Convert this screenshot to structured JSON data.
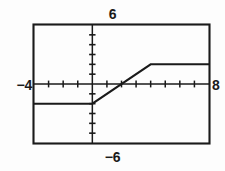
{
  "graph": {
    "title": "",
    "labels": {
      "xmin": "−4",
      "xmax": "8",
      "ymax": "6",
      "ymin": "−6"
    },
    "window": {
      "xmin_value": -4,
      "xmax_value": 8,
      "ymin_value": -6,
      "ymax_value": 6,
      "xscl": 1,
      "yscl": 1
    },
    "colors": {
      "frame": "#1a1a1a",
      "axis": "#1a1a1a",
      "curve": "#1a1a1a",
      "background": "#fdfdfd",
      "text": "#1a1a1a"
    }
  },
  "chart_data": {
    "type": "line",
    "title": "",
    "xlabel": "",
    "ylabel": "",
    "xlim": [
      -4,
      8
    ],
    "ylim": [
      -6,
      6
    ],
    "grid": false,
    "legend": null,
    "axis_ticks": {
      "x_major_step": 1,
      "y_major_step": 1,
      "x_ticks": [
        -4,
        -3,
        -2,
        -1,
        0,
        1,
        2,
        3,
        4,
        5,
        6,
        7,
        8
      ],
      "y_ticks": [
        -6,
        -5,
        -4,
        -3,
        -2,
        -1,
        0,
        1,
        2,
        3,
        4,
        5,
        6
      ]
    },
    "series": [
      {
        "name": "piecewise-clamped-ramp",
        "description": "Constant at -2 for x<=0, linear rise from (0,-2) to (4,2), constant at 2 for x>=4",
        "x": [
          -4,
          0,
          4,
          8
        ],
        "values": [
          -2,
          -2,
          2,
          2
        ],
        "points": [
          {
            "x": -4,
            "y": -2
          },
          {
            "x": 0,
            "y": -2
          },
          {
            "x": 4,
            "y": 2
          },
          {
            "x": 8,
            "y": 2
          }
        ]
      }
    ],
    "annotations": [
      {
        "label": "−4",
        "position": "left-axis-end"
      },
      {
        "label": "8",
        "position": "right-axis-end"
      },
      {
        "label": "6",
        "position": "top-axis-end"
      },
      {
        "label": "−6",
        "position": "bottom-axis-end"
      }
    ]
  }
}
